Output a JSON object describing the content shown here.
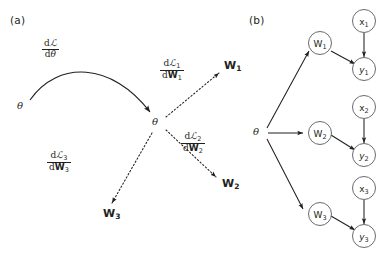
{
  "figure": {
    "width": 392,
    "height": 267,
    "background": "#ffffff",
    "ink_color": "#231f20"
  },
  "panel_a": {
    "label": "(a)",
    "source_theta": "θ",
    "center_theta": "θ",
    "main_gradient": {
      "numerator": "dℒ",
      "denominator": "dθ"
    },
    "branches": [
      {
        "name": "branch-1",
        "numerator": "dℒ₁",
        "denominator": "dW₁",
        "target": "W₁",
        "target_base": "W",
        "target_sub": "1",
        "style": "dotted"
      },
      {
        "name": "branch-2",
        "numerator": "dℒ₂",
        "denominator": "dW₂",
        "target": "W₂",
        "target_base": "W",
        "target_sub": "2",
        "style": "dotted"
      },
      {
        "name": "branch-3",
        "numerator": "dℒ₃",
        "denominator": "dW₃",
        "target": "W₃",
        "target_base": "W",
        "target_sub": "3",
        "style": "dotted"
      }
    ]
  },
  "panel_b": {
    "label": "(b)",
    "theta": "θ",
    "rows": [
      {
        "w": "W₁",
        "w_base": "W",
        "w_sub": "1",
        "x": "x₁",
        "x_base": "x",
        "x_sub": "1",
        "y": "y₁",
        "y_base": "y",
        "y_sub": "1"
      },
      {
        "w": "W₂",
        "w_base": "W",
        "w_sub": "2",
        "x": "x₂",
        "x_base": "x",
        "x_sub": "2",
        "y": "y₂",
        "y_base": "y",
        "y_sub": "2"
      },
      {
        "w": "W₃",
        "w_base": "W",
        "w_sub": "3",
        "x": "x₃",
        "x_base": "x",
        "x_sub": "3",
        "y": "y₃",
        "y_base": "y",
        "y_sub": "3"
      }
    ],
    "edges": [
      "theta-to-W1",
      "theta-to-W2",
      "theta-to-W3",
      "W1-to-y1",
      "W2-to-y2",
      "W3-to-y3",
      "x1-to-y1",
      "x2-to-y2",
      "x3-to-y3"
    ]
  }
}
